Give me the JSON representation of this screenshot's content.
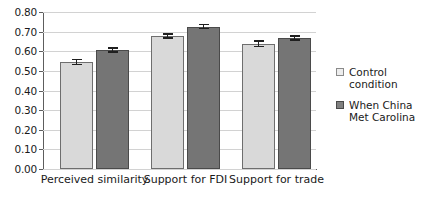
{
  "chart_data": {
    "type": "bar",
    "title": "",
    "subtitle": "",
    "xlabel": "",
    "ylabel": "",
    "ylim": [
      0.0,
      0.8
    ],
    "ytick_labels": [
      "0.00",
      "0.10",
      "0.20",
      "0.30",
      "0.40",
      "0.50",
      "0.60",
      "0.70",
      "0.80"
    ],
    "ytick_values": [
      0.0,
      0.1,
      0.2,
      0.3,
      0.4,
      0.5,
      0.6,
      0.7,
      0.8
    ],
    "grid": true,
    "legend_position": "right",
    "categories": [
      "Perceived similarity",
      "Support for FDI",
      "Support for trade"
    ],
    "series": [
      {
        "name": "Control condition",
        "color": "#d9d9d9",
        "values": [
          0.545,
          0.678,
          0.638
        ],
        "errors": [
          0.017,
          0.014,
          0.018
        ]
      },
      {
        "name": "When China Met Carolina",
        "color": "#757575",
        "values": [
          0.607,
          0.726,
          0.667
        ],
        "errors": [
          0.014,
          0.013,
          0.014
        ]
      }
    ]
  },
  "legend": {
    "items": [
      {
        "label_line1": "Control",
        "label_line2": "condition",
        "swatch": "control-swatch"
      },
      {
        "label_line1": "When China",
        "label_line2": "Met Carolina",
        "swatch": "treatment-swatch"
      }
    ]
  }
}
